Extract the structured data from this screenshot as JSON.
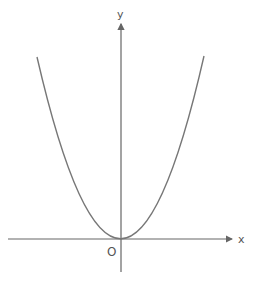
{
  "diagram": {
    "type": "parabola graph",
    "equation": "y = x^2",
    "axes": {
      "x_label": "x",
      "y_label": "y",
      "origin_label": "O"
    },
    "colors": {
      "axis": "#666666",
      "curve": "#777777",
      "text": "#555555"
    }
  }
}
